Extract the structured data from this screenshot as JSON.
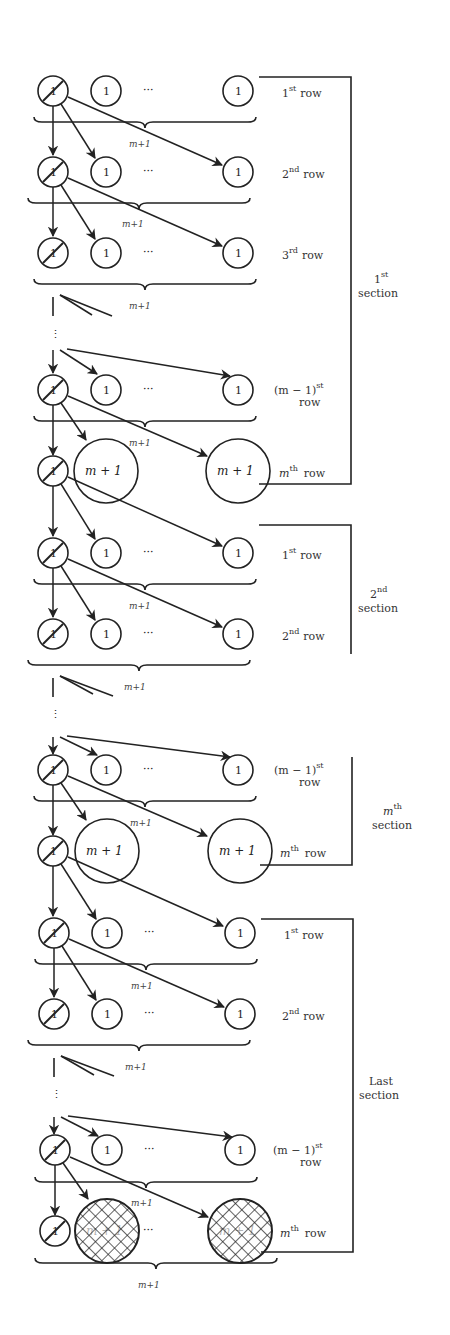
{
  "diagram": {
    "node_label_small": "1",
    "node_label_big": "m + 1",
    "ellipsis": "···",
    "brace_label": "m+1",
    "row_word": "row",
    "section_word": "section",
    "sections": [
      {
        "id": "first",
        "title_base": "1",
        "title_sup": "st",
        "rows": [
          {
            "base": "1",
            "sup": "st",
            "kind": "small"
          },
          {
            "base": "2",
            "sup": "nd",
            "kind": "small"
          },
          {
            "base": "3",
            "sup": "rd",
            "kind": "small"
          },
          {
            "base": "(m − 1)",
            "sup": "st",
            "kind": "small",
            "two_line": true
          },
          {
            "base": "m",
            "sup": "th",
            "kind": "big"
          }
        ]
      },
      {
        "id": "second",
        "title_base": "2",
        "title_sup": "nd",
        "rows": [
          {
            "base": "1",
            "sup": "st",
            "kind": "small"
          },
          {
            "base": "2",
            "sup": "nd",
            "kind": "small"
          }
        ]
      },
      {
        "id": "mth",
        "title_base": "m",
        "title_sup": "th",
        "rows": [
          {
            "base": "(m − 1)",
            "sup": "st",
            "kind": "small",
            "two_line": true
          },
          {
            "base": "m",
            "sup": "th",
            "kind": "big"
          }
        ]
      },
      {
        "id": "last",
        "title_base": "Last",
        "title_sup": "",
        "rows": [
          {
            "base": "1",
            "sup": "st",
            "kind": "small"
          },
          {
            "base": "2",
            "sup": "nd",
            "kind": "small"
          },
          {
            "base": "(m − 1)",
            "sup": "st",
            "kind": "small",
            "two_line": true
          },
          {
            "base": "m",
            "sup": "th",
            "kind": "hatched"
          }
        ]
      }
    ],
    "labels": {
      "s1_title": "1",
      "s1_title_sup": "st",
      "s2_title": "2",
      "s2_title_sup": "nd",
      "sm_title": "m",
      "sm_title_sup": "th",
      "sl_title": "Last",
      "section": "section",
      "row": "row",
      "r1": "1",
      "r1_sup": "st",
      "r2": "2",
      "r2_sup": "nd",
      "r3": "3",
      "r3_sup": "rd",
      "rm1": "(m − 1)",
      "rm1_sup": "st",
      "rm": "m",
      "rm_sup": "th"
    }
  }
}
